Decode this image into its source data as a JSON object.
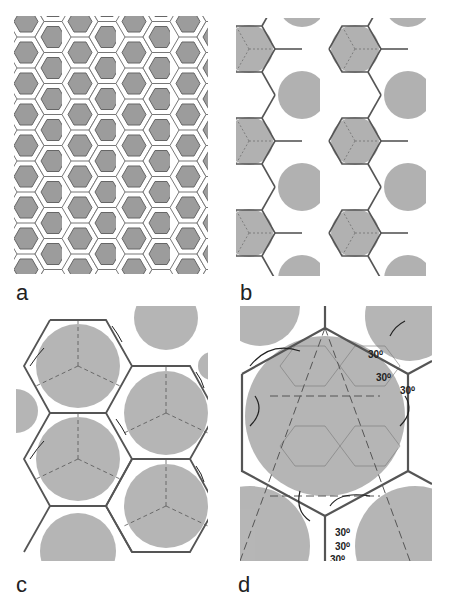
{
  "figure": {
    "panels": [
      {
        "id": "a",
        "label": "a",
        "description": "Tiling of grey hexagons with white hexagonal outlines"
      },
      {
        "id": "b",
        "label": "b",
        "description": "Hexagonal lattice overlaid on grey circles with rotation arrows"
      },
      {
        "id": "c",
        "label": "c",
        "description": "Larger-scale hexagonal lattice with circles and rotation arrows"
      },
      {
        "id": "d",
        "label": "d",
        "description": "Single large hexagon with rotation arrows and 30 degree angle annotations"
      }
    ],
    "annotations": {
      "angle_top_1": "30⁰",
      "angle_top_2": "30⁰",
      "angle_top_3": "30⁰",
      "angle_bottom_1": "30⁰",
      "angle_bottom_2": "30⁰",
      "angle_bottom_3": "30⁰"
    },
    "colors": {
      "hex_fill": "#9a9a9a",
      "circle_fill": "#a8a8a8",
      "lattice_line": "#555555",
      "text": "#222222"
    }
  }
}
